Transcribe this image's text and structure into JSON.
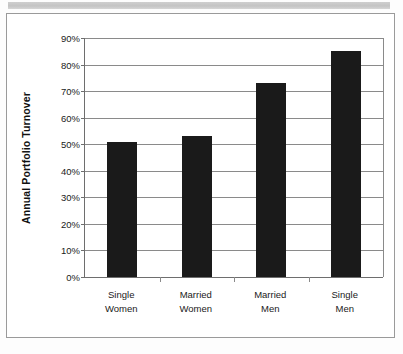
{
  "chart_data": {
    "type": "bar",
    "title": "",
    "subtitle": "",
    "xlabel": "",
    "ylabel": "Annual Portfolio Turnover",
    "categories": [
      "Single Women",
      "Married Women",
      "Married Men",
      "Single Men"
    ],
    "category_lines": [
      [
        "Single",
        "Women"
      ],
      [
        "Married",
        "Women"
      ],
      [
        "Married",
        "Men"
      ],
      [
        "Single",
        "Men"
      ]
    ],
    "values": [
      51,
      53,
      73,
      85
    ],
    "value_labels": [
      "51%",
      "53%",
      "73%",
      "85%"
    ],
    "ylim": [
      0,
      90
    ],
    "ytick_step": 10,
    "ytick_labels": [
      "0%",
      "10%",
      "20%",
      "30%",
      "40%",
      "50%",
      "60%",
      "70%",
      "80%",
      "90%"
    ],
    "ytick_values": [
      0,
      10,
      20,
      30,
      40,
      50,
      60,
      70,
      80,
      90
    ],
    "grid": "horizontal",
    "legend": "none",
    "bar_color": "#1a1a1a",
    "gridline_color": "#8a8a8a",
    "axis_color": "#6e6e6e",
    "plot_background": "#ffffff",
    "series": [
      {
        "name": "Annual Portfolio Turnover",
        "values": [
          51,
          53,
          73,
          85
        ]
      }
    ]
  },
  "figure": {
    "frame_color": "#9a9a9a",
    "scan_band_color": "#c8c8c8"
  }
}
